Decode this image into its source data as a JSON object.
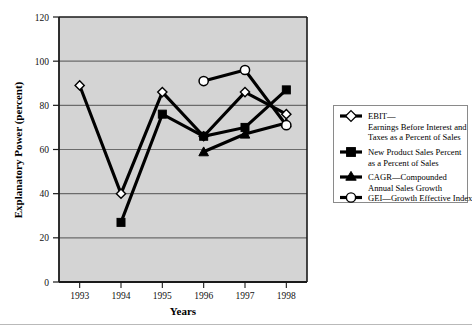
{
  "chart_data": {
    "type": "line",
    "title": "",
    "xlabel": "Years",
    "ylabel": "Explanatory Power (percent)",
    "categories": [
      "1993",
      "1994",
      "1995",
      "1996",
      "1997",
      "1998"
    ],
    "x": [
      1993,
      1994,
      1995,
      1996,
      1997,
      1998
    ],
    "xlim": [
      1992.5,
      1998.5
    ],
    "ylim": [
      0,
      120
    ],
    "yticks": [
      0,
      20,
      40,
      60,
      80,
      100,
      120
    ],
    "ytick_labels": [
      "0",
      "20",
      "40",
      "60",
      "80",
      "100",
      "120"
    ],
    "xtick_labels": [
      "1993",
      "1994",
      "1995",
      "1996",
      "1997",
      "1998"
    ],
    "grid": "horizontal",
    "plot_background": "#d4d4d4",
    "grid_color": "#6b6b6b",
    "line_color": "#000000",
    "legend_position": "right-outside",
    "series": [
      {
        "name": "EBIT",
        "marker": "open-diamond",
        "legend_key": "ebit",
        "values": [
          89,
          40,
          86,
          66,
          86,
          76
        ],
        "points": [
          {
            "x": 1993,
            "y": 89
          },
          {
            "x": 1994,
            "y": 40
          },
          {
            "x": 1995,
            "y": 86
          },
          {
            "x": 1996,
            "y": 66
          },
          {
            "x": 1997,
            "y": 86
          },
          {
            "x": 1998,
            "y": 76
          }
        ]
      },
      {
        "name": "New Product Sales Percent",
        "marker": "filled-square",
        "legend_key": "nps",
        "values": [
          null,
          27,
          76,
          66,
          70,
          87
        ],
        "points": [
          {
            "x": 1994,
            "y": 27
          },
          {
            "x": 1995,
            "y": 76
          },
          {
            "x": 1996,
            "y": 66
          },
          {
            "x": 1997,
            "y": 70
          },
          {
            "x": 1998,
            "y": 87
          }
        ]
      },
      {
        "name": "CAGR",
        "marker": "filled-triangle",
        "legend_key": "cagr",
        "values": [
          null,
          null,
          null,
          59,
          67,
          72
        ],
        "points": [
          {
            "x": 1996,
            "y": 59
          },
          {
            "x": 1997,
            "y": 67
          },
          {
            "x": 1998,
            "y": 72
          }
        ]
      },
      {
        "name": "GEI",
        "marker": "open-circle",
        "legend_key": "gei",
        "values": [
          null,
          null,
          null,
          91,
          96,
          71
        ],
        "points": [
          {
            "x": 1996,
            "y": 91
          },
          {
            "x": 1997,
            "y": 96
          },
          {
            "x": 1998,
            "y": 71
          }
        ]
      }
    ]
  },
  "axes": {
    "y_title": "Explanatory Power (percent)",
    "x_title": "Years",
    "y_labels": [
      "120",
      "100",
      "80",
      "60",
      "40",
      "20",
      "0"
    ],
    "x_labels": [
      "1993",
      "1994",
      "1995",
      "1996",
      "1997",
      "1998"
    ]
  },
  "legend": {
    "entries": [
      {
        "marker": "open-diamond",
        "line1": "EBIT—",
        "line2": "Earnings Before Interest and",
        "line3": "Taxes as a Percent of Sales"
      },
      {
        "marker": "filled-square",
        "line1": "New Product Sales Percent",
        "line2": "as a Percent of Sales",
        "line3": ""
      },
      {
        "marker": "filled-triangle",
        "line1": "CAGR—Compounded",
        "line2": "Annual Sales Growth",
        "line3": ""
      },
      {
        "marker": "open-circle",
        "line1": "GEI—Growth Effective Index",
        "line2": "",
        "line3": ""
      }
    ]
  },
  "colors": {
    "plot_fill": "#d4d4d4",
    "gridline": "#6b6b6b",
    "axis": "#1a1a1a",
    "series_line": "#000000",
    "legend_border": "#8a8a8a",
    "marker_fill_open": "#ffffff",
    "marker_fill_solid": "#000000"
  }
}
